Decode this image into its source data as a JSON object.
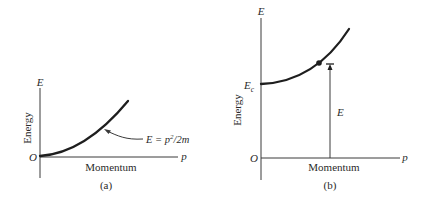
{
  "panels": [
    {
      "id": "a",
      "caption": "(a)",
      "y_axis_symbol": "E",
      "x_axis_symbol": "p",
      "origin_label": "O",
      "y_axis_title": "Energy",
      "x_axis_title": "Momentum",
      "curve_label": {
        "lhs": "E = p",
        "exponent": "2",
        "rhs": "/2m"
      }
    },
    {
      "id": "b",
      "caption": "(b)",
      "y_axis_symbol": "E",
      "x_axis_symbol": "p",
      "origin_label": "O",
      "y_axis_title": "Energy",
      "x_axis_title": "Momentum",
      "intercept_label": {
        "base": "E",
        "subscript": "c"
      },
      "marker_label": "E"
    }
  ],
  "colors": {
    "axis": "#3a3a3a",
    "curve": "#1e1e1e",
    "text": "#2a2a2a"
  }
}
